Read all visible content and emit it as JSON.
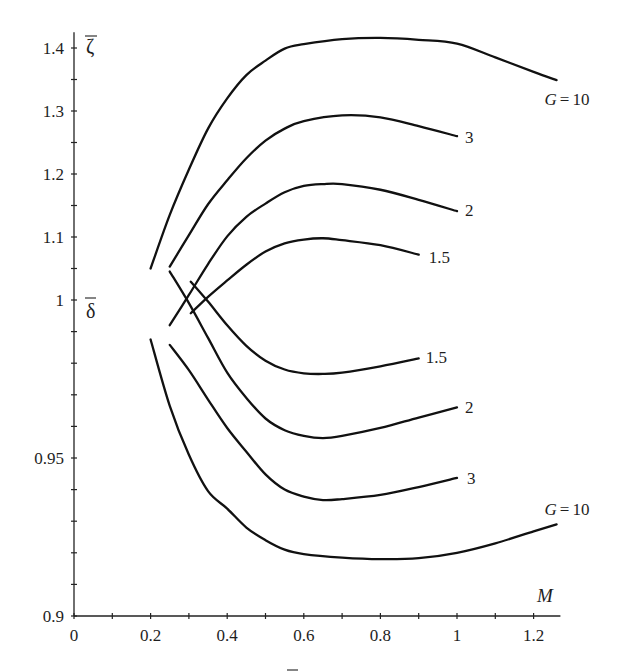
{
  "chart_data": {
    "type": "line",
    "title": "",
    "xlabel": "M",
    "ylabels": {
      "upper": {
        "symbol": "ζ",
        "text": "ζ̄"
      },
      "lower": {
        "symbol": "δ",
        "text": "δ̄"
      }
    },
    "xlim": [
      0,
      1.27
    ],
    "ylim_upper_zeta": [
      1.0,
      1.425
    ],
    "ylim_lower_delta": [
      0.9,
      1.0
    ],
    "grid": false,
    "legend": "inline labels at curve ends",
    "x_ticks": {
      "major": [
        {
          "value": 0,
          "label": "0"
        },
        {
          "value": 0.2,
          "label": "0.2"
        },
        {
          "value": 0.4,
          "label": "0.4"
        },
        {
          "value": 0.6,
          "label": "0.6"
        },
        {
          "value": 0.8,
          "label": "0.8"
        },
        {
          "value": 1.0,
          "label": "1"
        },
        {
          "value": 1.2,
          "label": "1.2"
        }
      ],
      "minor": [
        0.1,
        0.3,
        0.5,
        0.7,
        0.9,
        1.1
      ]
    },
    "y_ticks_zeta": {
      "major": [
        {
          "value": 1.1,
          "label": "1.1"
        },
        {
          "value": 1.2,
          "label": "1.2"
        },
        {
          "value": 1.3,
          "label": "1.3"
        },
        {
          "value": 1.4,
          "label": "1.4"
        }
      ],
      "minor": [
        1.05,
        1.15,
        1.25,
        1.35
      ]
    },
    "y_ticks_delta": {
      "major": [
        {
          "value": 1.0,
          "label": "1"
        },
        {
          "value": 0.95,
          "label": "0.95"
        },
        {
          "value": 0.9,
          "label": "0.9"
        }
      ],
      "minor": [
        0.99,
        0.98,
        0.97,
        0.96,
        0.94,
        0.93,
        0.92,
        0.91
      ]
    },
    "series": [
      {
        "id": "zeta-G10",
        "quantity": "ζ̄",
        "scale": "zeta",
        "G": 10,
        "label": {
          "symbol": "G",
          "relation": "=",
          "value": "10"
        },
        "x": [
          0.2,
          0.25,
          0.3,
          0.35,
          0.4,
          0.45,
          0.5,
          0.55,
          0.6,
          0.7,
          0.8,
          0.9,
          1.0,
          1.1,
          1.2,
          1.26
        ],
        "y": [
          1.05,
          1.135,
          1.207,
          1.272,
          1.32,
          1.357,
          1.38,
          1.399,
          1.406,
          1.414,
          1.416,
          1.413,
          1.407,
          1.385,
          1.362,
          1.349
        ]
      },
      {
        "id": "zeta-G3",
        "quantity": "ζ̄",
        "scale": "zeta",
        "G": 3,
        "label": {
          "value": "3"
        },
        "x": [
          0.25,
          0.3,
          0.35,
          0.4,
          0.45,
          0.5,
          0.55,
          0.6,
          0.7,
          0.8,
          0.9,
          1.0
        ],
        "y": [
          1.053,
          1.103,
          1.152,
          1.19,
          1.225,
          1.253,
          1.272,
          1.284,
          1.293,
          1.29,
          1.276,
          1.26
        ]
      },
      {
        "id": "zeta-G2",
        "quantity": "ζ̄",
        "scale": "zeta",
        "G": 2,
        "label": {
          "value": "2"
        },
        "x": [
          0.25,
          0.3,
          0.35,
          0.4,
          0.45,
          0.5,
          0.55,
          0.6,
          0.65,
          0.7,
          0.8,
          0.9,
          1.0
        ],
        "y": [
          0.96,
          1.008,
          1.057,
          1.101,
          1.132,
          1.153,
          1.171,
          1.181,
          1.184,
          1.184,
          1.175,
          1.159,
          1.141
        ]
      },
      {
        "id": "zeta-G1.5",
        "quantity": "ζ̄",
        "scale": "zeta",
        "G": 1.5,
        "label": {
          "value": "1.5"
        },
        "x": [
          0.305,
          0.35,
          0.4,
          0.45,
          0.5,
          0.55,
          0.6,
          0.65,
          0.7,
          0.8,
          0.9
        ],
        "y": [
          0.979,
          1.005,
          1.031,
          1.056,
          1.077,
          1.09,
          1.096,
          1.098,
          1.095,
          1.087,
          1.072
        ]
      },
      {
        "id": "delta-G1.5",
        "quantity": "δ̄",
        "scale": "delta",
        "G": 1.5,
        "label": {
          "value": "1.5"
        },
        "x": [
          0.305,
          0.35,
          0.4,
          0.45,
          0.5,
          0.55,
          0.6,
          0.65,
          0.7,
          0.8,
          0.9
        ],
        "y": [
          1.0058,
          0.9995,
          0.992,
          0.9855,
          0.9808,
          0.978,
          0.9768,
          0.9766,
          0.977,
          0.979,
          0.9815
        ]
      },
      {
        "id": "delta-G2",
        "quantity": "δ̄",
        "scale": "delta",
        "G": 2,
        "label": {
          "value": "2"
        },
        "x": [
          0.25,
          0.3,
          0.35,
          0.4,
          0.45,
          0.5,
          0.55,
          0.6,
          0.65,
          0.7,
          0.8,
          0.9,
          1.0
        ],
        "y": [
          1.009,
          0.999,
          0.988,
          0.977,
          0.969,
          0.9625,
          0.9588,
          0.957,
          0.9563,
          0.957,
          0.9595,
          0.9628,
          0.966
        ]
      },
      {
        "id": "delta-G3",
        "quantity": "δ̄",
        "scale": "delta",
        "G": 3,
        "label": {
          "value": "3"
        },
        "x": [
          0.25,
          0.3,
          0.35,
          0.4,
          0.45,
          0.5,
          0.55,
          0.6,
          0.65,
          0.7,
          0.8,
          0.9,
          1.0
        ],
        "y": [
          0.9858,
          0.9778,
          0.9685,
          0.9595,
          0.952,
          0.9448,
          0.94,
          0.9378,
          0.9367,
          0.937,
          0.9383,
          0.9408,
          0.9437
        ]
      },
      {
        "id": "delta-G10",
        "quantity": "δ̄",
        "scale": "delta",
        "G": 10,
        "label": {
          "symbol": "G",
          "relation": "=",
          "value": "10"
        },
        "x": [
          0.2,
          0.25,
          0.3,
          0.35,
          0.4,
          0.45,
          0.5,
          0.55,
          0.6,
          0.7,
          0.8,
          0.9,
          1.0,
          1.1,
          1.2,
          1.26
        ],
        "y": [
          0.9875,
          0.9665,
          0.951,
          0.9395,
          0.934,
          0.928,
          0.924,
          0.921,
          0.9196,
          0.9185,
          0.918,
          0.9183,
          0.92,
          0.923,
          0.9268,
          0.929
        ]
      }
    ]
  }
}
